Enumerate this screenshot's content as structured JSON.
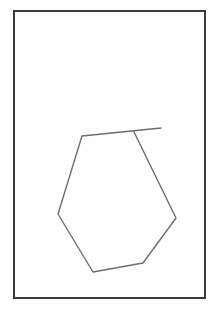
{
  "drawing": {
    "description": "Hand-drawn pencil sketch of an irregular hexagonal outline inside a rectangular frame",
    "canvas": {
      "width": 213,
      "height": 318,
      "background": "#ffffff"
    },
    "frame": {
      "x": 14,
      "y": 11,
      "width": 191,
      "height": 287,
      "stroke": "#3a3a3a",
      "stroke_width": 2
    },
    "shape": {
      "stroke": "#6e6e6e",
      "stroke_width": 1.4,
      "outline_points": "161,128 82,136 58,214 93,272 143,263 176,218 134,132",
      "note": "Top edge extends past the right branch, leaving an open stroke near the top-right"
    }
  }
}
